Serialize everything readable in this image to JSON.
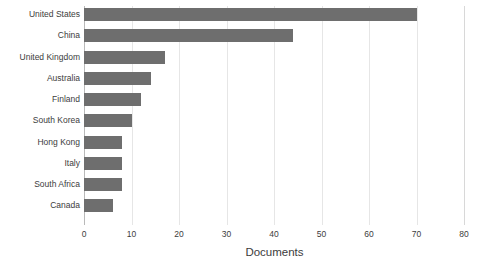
{
  "chart_data": {
    "type": "bar",
    "orientation": "horizontal",
    "title": "",
    "subtitle": "",
    "xlabel": "Documents",
    "ylabel": "",
    "xlim": [
      0,
      80
    ],
    "xticks": [
      0,
      10,
      20,
      30,
      40,
      50,
      60,
      70,
      80
    ],
    "xtick_labels": [
      "0",
      "10",
      "20",
      "30",
      "40",
      "50",
      "60",
      "70",
      "80"
    ],
    "grid": true,
    "grid_axis": "x",
    "legend": false,
    "legend_position": "none",
    "bar_color": "#6e6e6e",
    "categories": [
      "United States",
      "China",
      "United Kingdom",
      "Australia",
      "Finland",
      "South Korea",
      "Hong Kong",
      "Italy",
      "South Africa",
      "Canada"
    ],
    "values": [
      70,
      44,
      17,
      14,
      12,
      10,
      8,
      8,
      8,
      6
    ],
    "series": [
      {
        "name": "Documents",
        "values": [
          70,
          44,
          17,
          14,
          12,
          10,
          8,
          8,
          8,
          6
        ]
      }
    ],
    "annotations": []
  }
}
